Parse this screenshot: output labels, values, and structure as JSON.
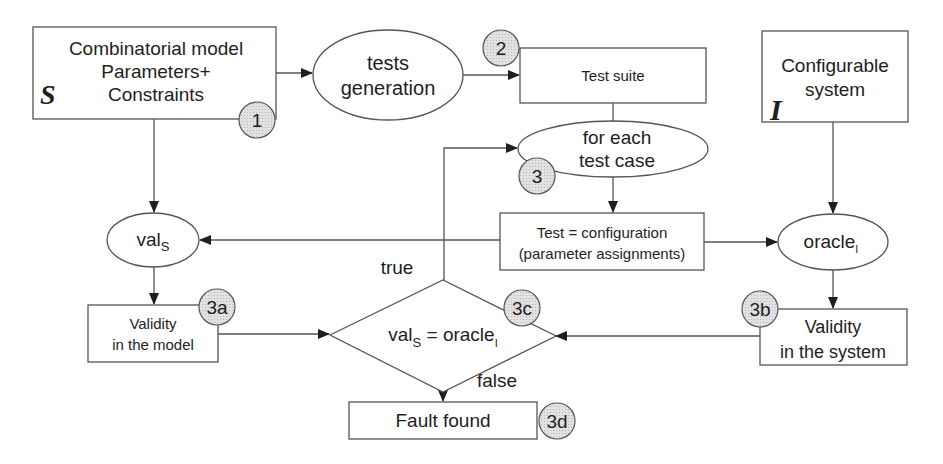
{
  "diagram": {
    "nodes": {
      "model": {
        "lines": [
          "Combinatorial model",
          "Parameters+",
          "Constraints"
        ],
        "symbol": "S",
        "badge": "1"
      },
      "tests_generation": {
        "lines": [
          "tests",
          "generation"
        ]
      },
      "test_suite": {
        "label": "Test suite",
        "badge": "2"
      },
      "for_each": {
        "lines": [
          "for each",
          "test case"
        ],
        "badge": "3"
      },
      "test_config": {
        "lines": [
          "Test = configuration",
          "(parameter assignments)"
        ]
      },
      "system": {
        "lines": [
          "Configurable",
          "system"
        ],
        "symbol": "I"
      },
      "val_s": {
        "base": "val",
        "sub": "S"
      },
      "oracle_i": {
        "base": "oracle",
        "sub": "I"
      },
      "validity_model": {
        "lines": [
          "Validity",
          "in the model"
        ],
        "badge": "3a"
      },
      "validity_system": {
        "lines": [
          "Validity",
          "in the system"
        ],
        "badge": "3b"
      },
      "decision": {
        "left_base": "val",
        "left_sub": "S",
        "op": " = ",
        "right_base": "oracle",
        "right_sub": "I",
        "badge": "3c"
      },
      "fault_found": {
        "label": "Fault found",
        "badge": "3d"
      }
    },
    "edge_labels": {
      "true": "true",
      "false": "false"
    },
    "colors": {
      "stroke": "#555555",
      "text": "#1e1e1e",
      "badge_fill": "#d9d9d9",
      "background": "#ffffff"
    }
  }
}
